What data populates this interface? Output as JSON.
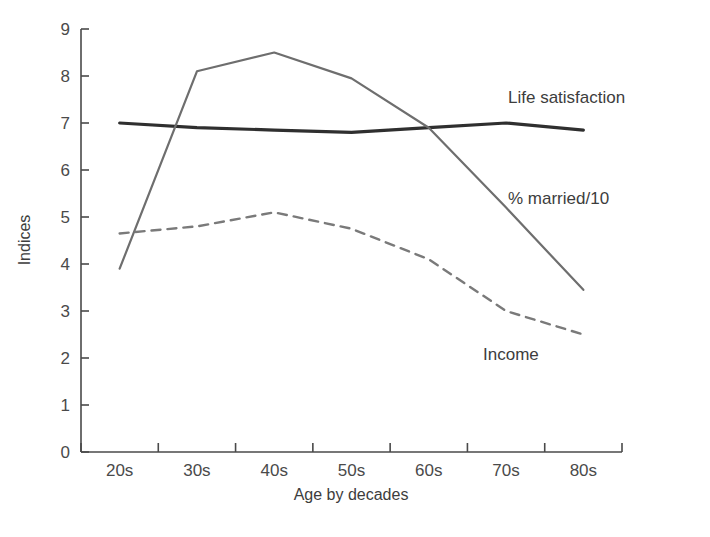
{
  "chart_data": {
    "type": "line",
    "title": "",
    "xlabel": "Age by decades",
    "ylabel": "Indices",
    "categories": [
      "20s",
      "30s",
      "40s",
      "50s",
      "60s",
      "70s",
      "80s"
    ],
    "ylim": [
      0,
      9
    ],
    "xlim_categories": 7,
    "yticks": [
      "0",
      "1",
      "2",
      "3",
      "4",
      "5",
      "6",
      "7",
      "8",
      "9"
    ],
    "grid": false,
    "legend_position": "inline-right-annotations",
    "series": [
      {
        "name": "Life satisfaction",
        "style": "solid",
        "color": "#2f2f2f",
        "width": 3.2,
        "values": [
          7.0,
          6.9,
          6.85,
          6.8,
          6.9,
          7.0,
          6.85
        ],
        "label_x": "80s",
        "label_text": "Life satisfaction"
      },
      {
        "name": "% married/10",
        "style": "solid",
        "color": "#6e6e6e",
        "width": 2.2,
        "values": [
          3.9,
          8.1,
          8.5,
          7.95,
          6.9,
          5.2,
          3.45
        ],
        "label_text": "% married/10"
      },
      {
        "name": "Income",
        "style": "dashed",
        "color": "#7a7a7a",
        "width": 2.4,
        "values": [
          4.65,
          4.8,
          5.1,
          4.75,
          4.1,
          3.0,
          2.5
        ],
        "label_text": "Income"
      }
    ],
    "annotations": [
      {
        "text": "Life satisfaction",
        "x": 508,
        "y": 103
      },
      {
        "text": "% married/10",
        "x": 508,
        "y": 204
      },
      {
        "text": "Income",
        "x": 483,
        "y": 360
      }
    ]
  },
  "axes": {
    "y_axis_title": "Indices",
    "x_axis_title": "Age by decades"
  }
}
